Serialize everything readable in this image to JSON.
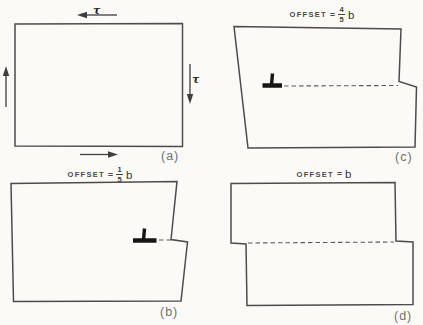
{
  "colors": {
    "background": "#fbfaf7",
    "line": "#4c4c4c",
    "dashed_slip_line": "#5a5a5a",
    "dislocation_symbol": "#161616",
    "panel_label": "#707070",
    "title_text": "#3e3e3e"
  },
  "panel_a": {
    "label": "(a)",
    "tau_top": "τ",
    "tau_right": "τ"
  },
  "panel_b": {
    "label": "(b)",
    "offset_word": "OFFSET",
    "equals": "=",
    "numerator": "1",
    "denominator": "5",
    "unit": "b",
    "dislocation_symbol": "⊥"
  },
  "panel_c": {
    "label": "(c)",
    "offset_word": "OFFSET",
    "equals": "=",
    "numerator": "4",
    "denominator": "5",
    "unit": "b",
    "dislocation_symbol": "⊥"
  },
  "panel_d": {
    "label": "(d)",
    "offset_word": "OFFSET",
    "equals": "=",
    "unit": "b"
  }
}
